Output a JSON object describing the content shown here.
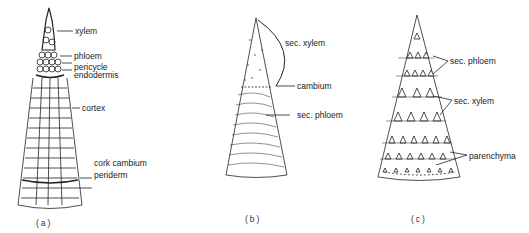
{
  "panels": [
    {
      "id": "a",
      "caption": "(a)",
      "labels": [
        "xylem",
        "phloem",
        "pericycle",
        "endodermis",
        "cortex",
        "cork cambium",
        "periderm"
      ]
    },
    {
      "id": "b",
      "caption": "(b)",
      "labels": [
        "sec. xylem",
        "cambium",
        "sec. phloem"
      ]
    },
    {
      "id": "c",
      "caption": "(c)",
      "labels": [
        "sec. phloem",
        "sec. xylem",
        "parenchyma"
      ]
    }
  ],
  "colors": {
    "ink": "#222222",
    "background": "#ffffff"
  }
}
